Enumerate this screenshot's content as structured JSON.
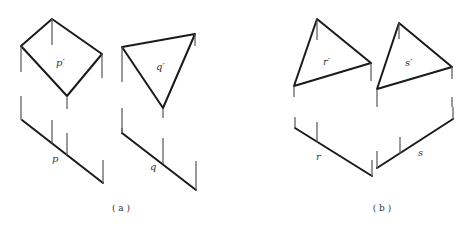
{
  "figures": [
    {
      "id": "a",
      "caption": "( a )",
      "caption_pos": [
        121,
        211
      ],
      "shapes": [
        {
          "name": "p",
          "front_label": "p′",
          "front_label_pos": [
            56,
            66
          ],
          "front_polygon": [
            [
              52,
              19
            ],
            [
              102,
              54
            ],
            [
              67,
              96
            ],
            [
              21,
              46
            ]
          ],
          "top_label": "p",
          "top_label_pos": [
            52,
            162
          ],
          "top_line": [
            [
              22,
              120
            ],
            [
              103,
              183
            ]
          ],
          "projectors": [
            [
              [
                52,
                19
              ],
              [
                52,
                45
              ]
            ],
            [
              [
                21,
                46
              ],
              [
                21,
                72
              ]
            ],
            [
              [
                102,
                54
              ],
              [
                102,
                78
              ]
            ],
            [
              [
                67,
                96
              ],
              [
                67,
                109
              ]
            ],
            [
              [
                21,
                96
              ],
              [
                21,
                120
              ]
            ],
            [
              [
                52,
                120
              ],
              [
                52,
                143
              ]
            ],
            [
              [
                67,
                133
              ],
              [
                67,
                155
              ]
            ],
            [
              [
                103,
                160
              ],
              [
                103,
                183
              ]
            ]
          ]
        },
        {
          "name": "q",
          "front_label": "q′",
          "front_label_pos": [
            156,
            70
          ],
          "front_polygon": [
            [
              122,
              47
            ],
            [
              195,
              34
            ],
            [
              163,
              108
            ]
          ],
          "top_label": "q",
          "top_label_pos": [
            150,
            170
          ],
          "top_line": [
            [
              122,
              133
            ],
            [
              196,
              190
            ]
          ],
          "projectors": [
            [
              [
                122,
                47
              ],
              [
                122,
                82
              ]
            ],
            [
              [
                195,
                34
              ],
              [
                195,
                46
              ]
            ],
            [
              [
                163,
                108
              ],
              [
                163,
                118
              ]
            ],
            [
              [
                122,
                108
              ],
              [
                122,
                133
              ]
            ],
            [
              [
                163,
                138
              ],
              [
                163,
                164
              ]
            ],
            [
              [
                196,
                161
              ],
              [
                196,
                190
              ]
            ],
            [
              [
                122,
                128
              ],
              [
                122,
                133
              ]
            ]
          ]
        }
      ]
    },
    {
      "id": "b",
      "caption": "( b )",
      "caption_pos": [
        382,
        211
      ],
      "shapes": [
        {
          "name": "r",
          "front_label": "r′",
          "front_label_pos": [
            323,
            65
          ],
          "front_polygon": [
            [
              317,
              19
            ],
            [
              371,
              63
            ],
            [
              294,
              86
            ]
          ],
          "top_label": "r",
          "top_label_pos": [
            316,
            160
          ],
          "top_line": [
            [
              295,
              128
            ],
            [
              372,
              176
            ]
          ],
          "projectors": [
            [
              [
                317,
                19
              ],
              [
                317,
                40
              ]
            ],
            [
              [
                294,
                86
              ],
              [
                294,
                97
              ]
            ],
            [
              [
                371,
                63
              ],
              [
                371,
                81
              ]
            ],
            [
              [
                295,
                117
              ],
              [
                295,
                128
              ]
            ],
            [
              [
                317,
                122
              ],
              [
                317,
                142
              ]
            ],
            [
              [
                372,
                160
              ],
              [
                372,
                176
              ]
            ]
          ]
        },
        {
          "name": "s",
          "front_label": "s′",
          "front_label_pos": [
            405,
            66
          ],
          "front_polygon": [
            [
              399,
              23
            ],
            [
              452,
              67
            ],
            [
              377,
              89
            ]
          ],
          "top_label": "s",
          "top_label_pos": [
            418,
            156
          ],
          "top_line": [
            [
              377,
              168
            ],
            [
              453,
              119
            ]
          ],
          "projectors": [
            [
              [
                399,
                23
              ],
              [
                399,
                39
              ]
            ],
            [
              [
                377,
                89
              ],
              [
                377,
                107
              ]
            ],
            [
              [
                452,
                67
              ],
              [
                452,
                79
              ]
            ],
            [
              [
                452,
                97
              ],
              [
                452,
                107
              ]
            ],
            [
              [
                377,
                151
              ],
              [
                377,
                168
              ]
            ],
            [
              [
                400,
                137
              ],
              [
                400,
                154
              ]
            ],
            [
              [
                453,
                107
              ],
              [
                453,
                119
              ]
            ]
          ]
        }
      ]
    }
  ],
  "colors": {
    "edge": "#1a1a1a",
    "projector": "#555555",
    "background": "#ffffff"
  }
}
